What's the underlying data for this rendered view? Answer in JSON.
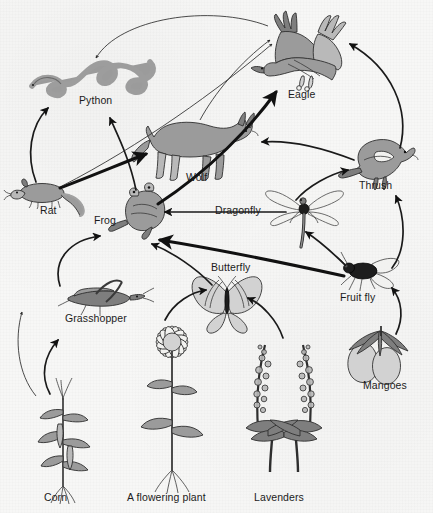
{
  "diagram": {
    "type": "food-web",
    "background_color": "#f7f7f6",
    "ink_color": "#1b1b1b",
    "organisms": [
      {
        "id": "python",
        "label": "Python",
        "role": "predator",
        "x": 96,
        "y": 100,
        "art_x": 75,
        "art_y": 58
      },
      {
        "id": "eagle",
        "label": "Eagle",
        "role": "apex-predator",
        "x": 304,
        "y": 94,
        "art_x": 303,
        "art_y": 48
      },
      {
        "id": "wolf",
        "label": "Wolf",
        "role": "predator",
        "x": 197,
        "y": 177,
        "art_x": 196,
        "art_y": 140
      },
      {
        "id": "rat",
        "label": "Rat",
        "role": "primary-consumer",
        "x": 48,
        "y": 210,
        "art_x": 40,
        "art_y": 189
      },
      {
        "id": "frog",
        "label": "Frog",
        "role": "secondary-consumer",
        "x": 107,
        "y": 220,
        "art_x": 140,
        "art_y": 212
      },
      {
        "id": "dragonfly",
        "label": "Dragonfly",
        "role": "predator-insect",
        "x": 237,
        "y": 210,
        "art_x": 305,
        "art_y": 208
      },
      {
        "id": "thrush",
        "label": "Thrush",
        "role": "secondary-consumer",
        "x": 377,
        "y": 185,
        "art_x": 382,
        "art_y": 155
      },
      {
        "id": "butterfly",
        "label": "Butterfly",
        "role": "primary-consumer",
        "x": 232,
        "y": 267,
        "art_x": 227,
        "art_y": 296
      },
      {
        "id": "fruitfly",
        "label": "Fruit fly",
        "role": "primary-consumer",
        "x": 360,
        "y": 297,
        "art_x": 368,
        "art_y": 272
      },
      {
        "id": "grasshopper",
        "label": "Grasshopper",
        "role": "primary-consumer",
        "x": 94,
        "y": 318,
        "art_x": 95,
        "art_y": 296
      },
      {
        "id": "mangoes",
        "label": "Mangoes",
        "role": "producer-fruit",
        "x": 383,
        "y": 385,
        "art_x": 382,
        "art_y": 352
      },
      {
        "id": "corn",
        "label": "Corn",
        "role": "producer",
        "x": 55,
        "y": 497,
        "art_x": 72,
        "art_y": 420
      },
      {
        "id": "flower",
        "label": "A flowering plant",
        "role": "producer",
        "x": 170,
        "y": 497,
        "art_x": 172,
        "art_y": 415
      },
      {
        "id": "lavenders",
        "label": "Lavenders",
        "role": "producer",
        "x": 283,
        "y": 497,
        "art_x": 283,
        "art_y": 420
      }
    ],
    "links": [
      {
        "from": "corn",
        "to": "grasshopper",
        "style": "curved"
      },
      {
        "from": "corn",
        "to": "rat",
        "style": "curved"
      },
      {
        "from": "grasshopper",
        "to": "frog",
        "style": "curved"
      },
      {
        "from": "flower",
        "to": "butterfly",
        "style": "curved"
      },
      {
        "from": "lavenders",
        "to": "butterfly",
        "style": "curved"
      },
      {
        "from": "mangoes",
        "to": "fruitfly",
        "style": "curved"
      },
      {
        "from": "butterfly",
        "to": "frog",
        "style": "curved"
      },
      {
        "from": "fruitfly",
        "to": "frog",
        "style": "straight"
      },
      {
        "from": "fruitfly",
        "to": "dragonfly",
        "style": "straight"
      },
      {
        "from": "fruitfly",
        "to": "thrush",
        "style": "curved"
      },
      {
        "from": "dragonfly",
        "to": "frog",
        "style": "straight"
      },
      {
        "from": "dragonfly",
        "to": "thrush",
        "style": "curved"
      },
      {
        "from": "frog",
        "to": "python",
        "style": "curved"
      },
      {
        "from": "frog",
        "to": "eagle",
        "style": "straight"
      },
      {
        "from": "rat",
        "to": "python",
        "style": "curved"
      },
      {
        "from": "rat",
        "to": "wolf",
        "style": "straight"
      },
      {
        "from": "rat",
        "to": "eagle",
        "style": "thin"
      },
      {
        "from": "wolf",
        "to": "eagle",
        "style": "thin"
      },
      {
        "from": "thrush",
        "to": "eagle",
        "style": "curved"
      },
      {
        "from": "thrush",
        "to": "wolf",
        "style": "curved"
      },
      {
        "from": "eagle",
        "to": "python",
        "style": "curved"
      }
    ]
  }
}
